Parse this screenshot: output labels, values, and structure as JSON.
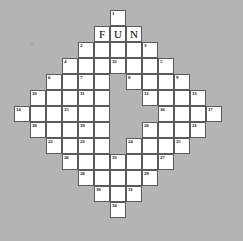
{
  "puzzle": {
    "title": "FUN Crossword Grid",
    "shape": "diamond",
    "background_color": "#b4b4b4",
    "cell_color": "#ffffff",
    "border_color": "#5a5a5a",
    "cell_size": 16,
    "origin_x": 14,
    "origin_y": 10,
    "columns": 13,
    "rows": 13,
    "filled_word": "FUN",
    "cells": [
      {
        "col": 6,
        "row": 0,
        "number": "1",
        "letter": ""
      },
      {
        "col": 5,
        "row": 1,
        "number": "",
        "letter": "F"
      },
      {
        "col": 6,
        "row": 1,
        "number": "",
        "letter": "U"
      },
      {
        "col": 7,
        "row": 1,
        "number": "",
        "letter": "N"
      },
      {
        "col": 4,
        "row": 2,
        "number": "2",
        "letter": ""
      },
      {
        "col": 5,
        "row": 2,
        "number": "",
        "letter": ""
      },
      {
        "col": 6,
        "row": 2,
        "number": "",
        "letter": ""
      },
      {
        "col": 7,
        "row": 2,
        "number": "",
        "letter": ""
      },
      {
        "col": 8,
        "row": 2,
        "number": "3",
        "letter": ""
      },
      {
        "col": 3,
        "row": 3,
        "number": "4",
        "letter": ""
      },
      {
        "col": 4,
        "row": 3,
        "number": "",
        "letter": ""
      },
      {
        "col": 5,
        "row": 3,
        "number": "",
        "letter": ""
      },
      {
        "col": 6,
        "row": 3,
        "number": "32",
        "letter": ""
      },
      {
        "col": 7,
        "row": 3,
        "number": "",
        "letter": ""
      },
      {
        "col": 8,
        "row": 3,
        "number": "",
        "letter": ""
      },
      {
        "col": 9,
        "row": 3,
        "number": "5",
        "letter": ""
      },
      {
        "col": 2,
        "row": 4,
        "number": "6",
        "letter": ""
      },
      {
        "col": 3,
        "row": 4,
        "number": "",
        "letter": ""
      },
      {
        "col": 4,
        "row": 4,
        "number": "7",
        "letter": ""
      },
      {
        "col": 5,
        "row": 4,
        "number": "",
        "letter": ""
      },
      {
        "col": 7,
        "row": 4,
        "number": "8",
        "letter": ""
      },
      {
        "col": 8,
        "row": 4,
        "number": "",
        "letter": ""
      },
      {
        "col": 9,
        "row": 4,
        "number": "",
        "letter": ""
      },
      {
        "col": 10,
        "row": 4,
        "number": "9",
        "letter": ""
      },
      {
        "col": 1,
        "row": 5,
        "number": "10",
        "letter": ""
      },
      {
        "col": 2,
        "row": 5,
        "number": "",
        "letter": ""
      },
      {
        "col": 3,
        "row": 5,
        "number": "",
        "letter": ""
      },
      {
        "col": 4,
        "row": 5,
        "number": "11",
        "letter": ""
      },
      {
        "col": 5,
        "row": 5,
        "number": "",
        "letter": ""
      },
      {
        "col": 8,
        "row": 5,
        "number": "12",
        "letter": ""
      },
      {
        "col": 9,
        "row": 5,
        "number": "",
        "letter": ""
      },
      {
        "col": 10,
        "row": 5,
        "number": "",
        "letter": ""
      },
      {
        "col": 11,
        "row": 5,
        "number": "13",
        "letter": ""
      },
      {
        "col": 0,
        "row": 6,
        "number": "14",
        "letter": ""
      },
      {
        "col": 1,
        "row": 6,
        "number": "",
        "letter": ""
      },
      {
        "col": 2,
        "row": 6,
        "number": "",
        "letter": ""
      },
      {
        "col": 3,
        "row": 6,
        "number": "15",
        "letter": ""
      },
      {
        "col": 4,
        "row": 6,
        "number": "",
        "letter": ""
      },
      {
        "col": 5,
        "row": 6,
        "number": "",
        "letter": ""
      },
      {
        "col": 9,
        "row": 6,
        "number": "16",
        "letter": ""
      },
      {
        "col": 10,
        "row": 6,
        "number": "",
        "letter": ""
      },
      {
        "col": 11,
        "row": 6,
        "number": "",
        "letter": ""
      },
      {
        "col": 12,
        "row": 6,
        "number": "17",
        "letter": ""
      },
      {
        "col": 1,
        "row": 7,
        "number": "18",
        "letter": ""
      },
      {
        "col": 2,
        "row": 7,
        "number": "",
        "letter": ""
      },
      {
        "col": 3,
        "row": 7,
        "number": "",
        "letter": ""
      },
      {
        "col": 4,
        "row": 7,
        "number": "19",
        "letter": ""
      },
      {
        "col": 5,
        "row": 7,
        "number": "",
        "letter": ""
      },
      {
        "col": 8,
        "row": 7,
        "number": "20",
        "letter": ""
      },
      {
        "col": 9,
        "row": 7,
        "number": "",
        "letter": ""
      },
      {
        "col": 10,
        "row": 7,
        "number": "",
        "letter": ""
      },
      {
        "col": 11,
        "row": 7,
        "number": "21",
        "letter": ""
      },
      {
        "col": 2,
        "row": 8,
        "number": "22",
        "letter": ""
      },
      {
        "col": 3,
        "row": 8,
        "number": "",
        "letter": ""
      },
      {
        "col": 4,
        "row": 8,
        "number": "23",
        "letter": ""
      },
      {
        "col": 5,
        "row": 8,
        "number": "",
        "letter": ""
      },
      {
        "col": 7,
        "row": 8,
        "number": "24",
        "letter": ""
      },
      {
        "col": 8,
        "row": 8,
        "number": "",
        "letter": ""
      },
      {
        "col": 9,
        "row": 8,
        "number": "",
        "letter": ""
      },
      {
        "col": 10,
        "row": 8,
        "number": "25",
        "letter": ""
      },
      {
        "col": 3,
        "row": 9,
        "number": "26",
        "letter": ""
      },
      {
        "col": 4,
        "row": 9,
        "number": "",
        "letter": ""
      },
      {
        "col": 5,
        "row": 9,
        "number": "",
        "letter": ""
      },
      {
        "col": 6,
        "row": 9,
        "number": "33",
        "letter": ""
      },
      {
        "col": 7,
        "row": 9,
        "number": "",
        "letter": ""
      },
      {
        "col": 8,
        "row": 9,
        "number": "",
        "letter": ""
      },
      {
        "col": 9,
        "row": 9,
        "number": "27",
        "letter": ""
      },
      {
        "col": 4,
        "row": 10,
        "number": "28",
        "letter": ""
      },
      {
        "col": 5,
        "row": 10,
        "number": "",
        "letter": ""
      },
      {
        "col": 6,
        "row": 10,
        "number": "",
        "letter": ""
      },
      {
        "col": 7,
        "row": 10,
        "number": "",
        "letter": ""
      },
      {
        "col": 8,
        "row": 10,
        "number": "29",
        "letter": ""
      },
      {
        "col": 5,
        "row": 11,
        "number": "30",
        "letter": ""
      },
      {
        "col": 6,
        "row": 11,
        "number": "",
        "letter": ""
      },
      {
        "col": 7,
        "row": 11,
        "number": "31",
        "letter": ""
      },
      {
        "col": 6,
        "row": 12,
        "number": "34",
        "letter": ""
      }
    ]
  }
}
